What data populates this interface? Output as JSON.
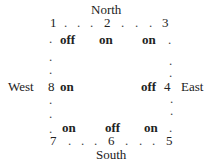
{
  "compass": {
    "north": "North",
    "south": "South",
    "east": "East",
    "west": "West"
  },
  "nodes": {
    "n1": "1",
    "n2": "2",
    "n3": "3",
    "n4": "4",
    "n5": "5",
    "n6": "6",
    "n7": "7",
    "n8": "8"
  },
  "switches": {
    "top_left": "off",
    "top_mid": "on",
    "top_right": "on",
    "right": "off",
    "left": "on",
    "bottom_left": "on",
    "bottom_mid": "off",
    "bottom_right": "on"
  },
  "dot": "."
}
